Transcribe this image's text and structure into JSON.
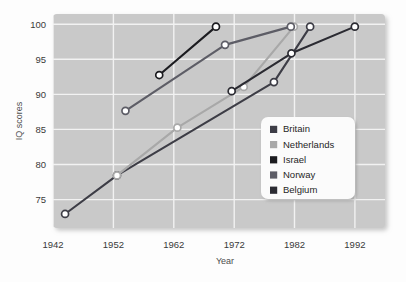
{
  "chart_data": {
    "type": "line",
    "title": "",
    "xlabel": "Year",
    "ylabel": "IQ scores",
    "xlim": [
      1942,
      1997
    ],
    "ylim": [
      71.5,
      102
    ],
    "xticks": [
      1942,
      1952,
      1962,
      1972,
      1982,
      1992
    ],
    "yticks": [
      75,
      80,
      85,
      90,
      95,
      100
    ],
    "grid": true,
    "legend_position": "lower-right-inside",
    "markers": "open-circle",
    "series": [
      {
        "name": "Britain",
        "color": "#3d3d46",
        "points": [
          {
            "x": 1944.0,
            "y": 73.5
          },
          {
            "x": 1952.6,
            "y": 79.0
          },
          {
            "x": 1978.6,
            "y": 92.3
          },
          {
            "x": 1984.6,
            "y": 100.2
          }
        ]
      },
      {
        "name": "Netherlands",
        "color": "#a8a8a8",
        "points": [
          {
            "x": 1952.6,
            "y": 79.0
          },
          {
            "x": 1962.6,
            "y": 85.8
          },
          {
            "x": 1973.6,
            "y": 91.6
          },
          {
            "x": 1981.9,
            "y": 100.2
          }
        ]
      },
      {
        "name": "Israel",
        "color": "#1c1c20",
        "points": [
          {
            "x": 1959.6,
            "y": 93.3
          },
          {
            "x": 1969.0,
            "y": 100.2
          }
        ]
      },
      {
        "name": "Norway",
        "color": "#5d5d66",
        "points": [
          {
            "x": 1954.0,
            "y": 88.2
          },
          {
            "x": 1970.5,
            "y": 97.6
          },
          {
            "x": 1981.4,
            "y": 100.2
          }
        ]
      },
      {
        "name": "Belgium",
        "color": "#2b2b32",
        "points": [
          {
            "x": 1971.6,
            "y": 91.0
          },
          {
            "x": 1981.5,
            "y": 96.4
          },
          {
            "x": 1992.0,
            "y": 100.2
          }
        ]
      }
    ]
  },
  "axis": {
    "y_title": "IQ scores",
    "x_title": "Year",
    "x_tick_labels": [
      "1942",
      "1952",
      "1962",
      "1972",
      "1982",
      "1992"
    ],
    "y_tick_labels": [
      "75",
      "80",
      "85",
      "90",
      "95",
      "100"
    ]
  },
  "legend": {
    "items": [
      {
        "label": "Britain",
        "swatch": "#3d3d46"
      },
      {
        "label": "Netherlands",
        "swatch": "#a8a8a8"
      },
      {
        "label": "Israel",
        "swatch": "#1c1c20"
      },
      {
        "label": "Norway",
        "swatch": "#5d5d66"
      },
      {
        "label": "Belgium",
        "swatch": "#2b2b32"
      }
    ]
  },
  "style": {
    "plot_background": "#c9c9c9",
    "grid_color": "#f2f2f2",
    "marker_fill": "#ffffff",
    "legend_background": "#fbfbfb",
    "page_background": "#fdfdfd"
  }
}
